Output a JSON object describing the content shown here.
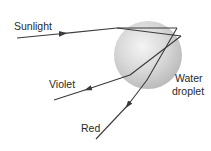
{
  "diagram": {
    "labels": {
      "sunlight": "Sunlight",
      "violet": "Violet",
      "red": "Red",
      "droplet_line1": "Water",
      "droplet_line2": "droplet"
    },
    "colors": {
      "ray": "#3a3a3a",
      "droplet_light": "#f2f2f2",
      "droplet_mid": "#d4d4d4",
      "droplet_dark": "#b8b8b8",
      "text": "#2a2a2a"
    }
  }
}
